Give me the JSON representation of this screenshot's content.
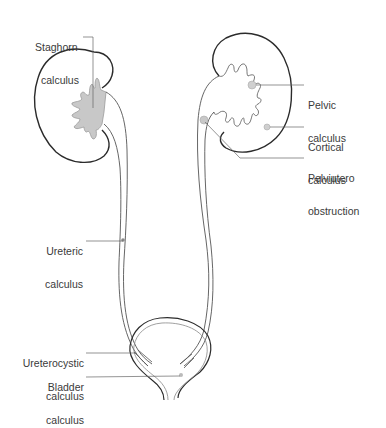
{
  "diagram": {
    "colors": {
      "outline": "#2b2b2b",
      "ureter": "#555555",
      "stone_fill": "#c8c8c8",
      "leader": "#666666",
      "text": "#3a3a3a"
    },
    "labels": {
      "staghorn": {
        "line1": "Staghorn",
        "line2": "calculus"
      },
      "pelvic": {
        "line1": "Pelvic",
        "line2": "calculus"
      },
      "cortical": {
        "line1": "Cortical",
        "line2": "calculus"
      },
      "pelviutero": {
        "line1": "Pelviutero",
        "line2": "obstruction"
      },
      "ureteric": {
        "line1": "Ureteric",
        "line2": "calculus"
      },
      "ureterocystic": {
        "line1": "Ureterocystic",
        "line2": "calculus"
      },
      "bladder": {
        "line1": "Bladder",
        "line2": "calculus"
      }
    },
    "structures": [
      "left-kidney",
      "right-kidney",
      "left-ureter",
      "right-ureter",
      "bladder",
      "urethra"
    ]
  }
}
